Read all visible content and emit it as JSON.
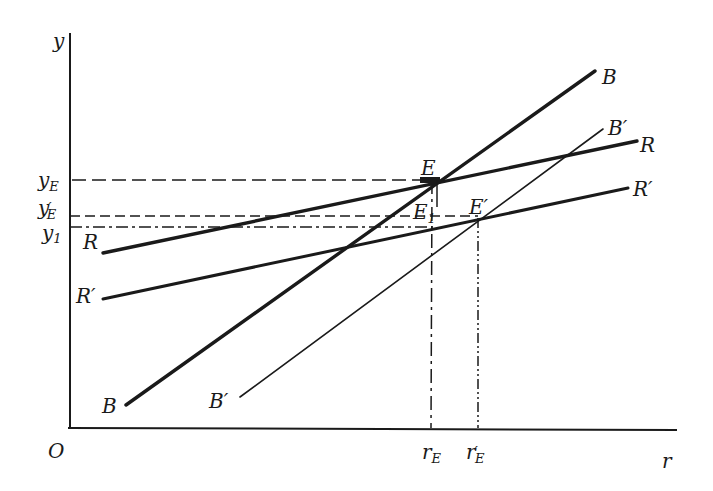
{
  "axes": {
    "y_label": "y",
    "x_label": "r",
    "origin_label": "O"
  },
  "y_ticks": [
    {
      "main": "y",
      "prime": "",
      "sub": "E",
      "id": "yE"
    },
    {
      "main": "y",
      "prime": "′",
      "sub": "E",
      "id": "yE_prime"
    },
    {
      "main": "y",
      "prime": "",
      "sub": "1",
      "id": "y1"
    }
  ],
  "x_ticks": [
    {
      "main": "r",
      "prime": "",
      "sub": "E",
      "id": "rE"
    },
    {
      "main": "r",
      "prime": "′",
      "sub": "E",
      "id": "rE_prime"
    }
  ],
  "curves": {
    "R": {
      "label_left": "R",
      "label_right": "R"
    },
    "R_prime": {
      "label_left": "R′",
      "label_right": "R′"
    },
    "B": {
      "label_left": "B",
      "label_right": "B"
    },
    "B_prime": {
      "label_left": "B′",
      "label_right": "B′"
    }
  },
  "points": {
    "E": {
      "main": "E",
      "sub": ""
    },
    "E1": {
      "main": "E",
      "sub": "1"
    },
    "E_prime": {
      "main": "E′",
      "sub": ""
    }
  },
  "colors": {
    "ink": "#1a1a1a",
    "background": "#ffffff"
  }
}
